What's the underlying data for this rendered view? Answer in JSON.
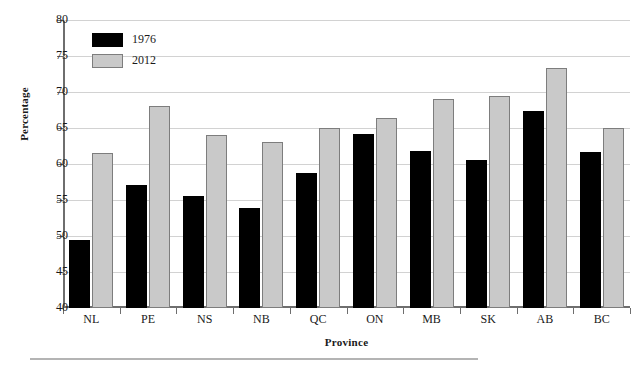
{
  "chart_data": {
    "type": "bar",
    "title": "",
    "xlabel": "Province",
    "ylabel": "Percentage",
    "categories": [
      "NL",
      "PE",
      "NS",
      "NB",
      "QC",
      "ON",
      "MB",
      "SK",
      "AB",
      "BC"
    ],
    "series": [
      {
        "name": "1976",
        "color": "#000000",
        "values": [
          49.5,
          57.1,
          55.6,
          53.9,
          58.8,
          64.2,
          61.8,
          60.5,
          67.3,
          61.7
        ]
      },
      {
        "name": "2012",
        "color": "#c9c9c9",
        "values": [
          61.5,
          68.0,
          64.0,
          63.0,
          65.0,
          66.4,
          69.0,
          69.5,
          73.3,
          65.0
        ]
      }
    ],
    "ylim": [
      40,
      80
    ],
    "ytick_values": [
      40,
      45,
      50,
      55,
      60,
      65,
      70,
      75,
      80
    ],
    "ytick_labels": [
      "40",
      "45",
      "50",
      "55",
      "60",
      "65",
      "70",
      "75",
      "80"
    ],
    "grid": true,
    "grid_axis": "y",
    "legend_position": "top-left"
  },
  "legend": {
    "entries": [
      {
        "label": "1976"
      },
      {
        "label": "2012"
      }
    ]
  },
  "axes": {
    "y_title": "Percentage",
    "x_title": "Province"
  }
}
